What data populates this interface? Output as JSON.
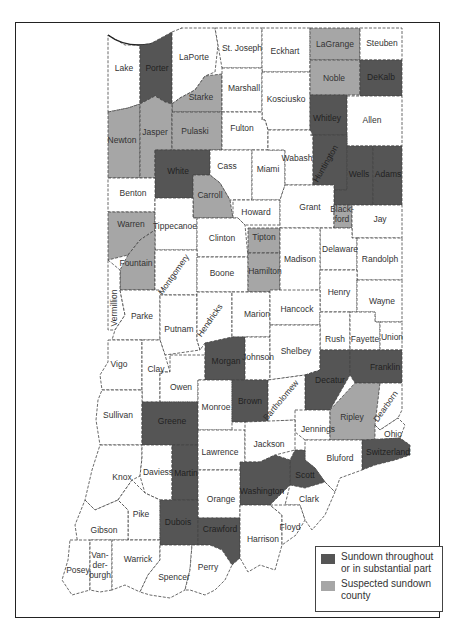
{
  "map": {
    "title": "Indiana sundown counties",
    "colors": {
      "sundown": "#555555",
      "suspected": "#a6a6a6",
      "none": "#ffffff"
    },
    "counties": [
      {
        "name": "Lake",
        "status": "none"
      },
      {
        "name": "Porter",
        "status": "sundown"
      },
      {
        "name": "LaPorte",
        "status": "none"
      },
      {
        "name": "St. Joseph",
        "status": "none"
      },
      {
        "name": "Eckhart",
        "status": "none"
      },
      {
        "name": "LaGrange",
        "status": "suspected"
      },
      {
        "name": "Steuben",
        "status": "none"
      },
      {
        "name": "Noble",
        "status": "suspected"
      },
      {
        "name": "DeKalb",
        "status": "sundown"
      },
      {
        "name": "Starke",
        "status": "suspected"
      },
      {
        "name": "Marshall",
        "status": "none"
      },
      {
        "name": "Kosciusko",
        "status": "none"
      },
      {
        "name": "Whitley",
        "status": "sundown"
      },
      {
        "name": "Allen",
        "status": "none"
      },
      {
        "name": "Newton",
        "status": "suspected"
      },
      {
        "name": "Jasper",
        "status": "suspected"
      },
      {
        "name": "Pulaski",
        "status": "suspected"
      },
      {
        "name": "Fulton",
        "status": "none"
      },
      {
        "name": "White",
        "status": "sundown"
      },
      {
        "name": "Cass",
        "status": "none"
      },
      {
        "name": "Miami",
        "status": "none"
      },
      {
        "name": "Wabash",
        "status": "none"
      },
      {
        "name": "Huntington",
        "status": "sundown"
      },
      {
        "name": "Wells",
        "status": "sundown"
      },
      {
        "name": "Adams",
        "status": "sundown"
      },
      {
        "name": "Benton",
        "status": "none"
      },
      {
        "name": "Carroll",
        "status": "suspected"
      },
      {
        "name": "Howard",
        "status": "none"
      },
      {
        "name": "Grant",
        "status": "none"
      },
      {
        "name": "Blackford",
        "status": "suspected"
      },
      {
        "name": "Jay",
        "status": "none"
      },
      {
        "name": "Warren",
        "status": "suspected"
      },
      {
        "name": "Tippecanoe",
        "status": "none"
      },
      {
        "name": "Clinton",
        "status": "none"
      },
      {
        "name": "Tipton",
        "status": "suspected"
      },
      {
        "name": "Delaware",
        "status": "none"
      },
      {
        "name": "Randolph",
        "status": "none"
      },
      {
        "name": "Fountain",
        "status": "suspected"
      },
      {
        "name": "Montgomery",
        "status": "none"
      },
      {
        "name": "Boone",
        "status": "none"
      },
      {
        "name": "Hamilton",
        "status": "suspected"
      },
      {
        "name": "Madison",
        "status": "none"
      },
      {
        "name": "Henry",
        "status": "none"
      },
      {
        "name": "Wayne",
        "status": "none"
      },
      {
        "name": "Vermillion",
        "status": "none"
      },
      {
        "name": "Parke",
        "status": "none"
      },
      {
        "name": "Putnam",
        "status": "none"
      },
      {
        "name": "Hendricks",
        "status": "none"
      },
      {
        "name": "Marion",
        "status": "none"
      },
      {
        "name": "Hancock",
        "status": "none"
      },
      {
        "name": "Rush",
        "status": "none"
      },
      {
        "name": "Fayette",
        "status": "none"
      },
      {
        "name": "Union",
        "status": "none"
      },
      {
        "name": "Vigo",
        "status": "none"
      },
      {
        "name": "Clay",
        "status": "none"
      },
      {
        "name": "Owen",
        "status": "none"
      },
      {
        "name": "Morgan",
        "status": "sundown"
      },
      {
        "name": "Johnson",
        "status": "none"
      },
      {
        "name": "Shelbey",
        "status": "none"
      },
      {
        "name": "Decatur",
        "status": "sundown"
      },
      {
        "name": "Franklin",
        "status": "sundown"
      },
      {
        "name": "Sullivan",
        "status": "none"
      },
      {
        "name": "Greene",
        "status": "sundown"
      },
      {
        "name": "Monroe",
        "status": "none"
      },
      {
        "name": "Brown",
        "status": "sundown"
      },
      {
        "name": "Bartholomew",
        "status": "none"
      },
      {
        "name": "Jennings",
        "status": "none"
      },
      {
        "name": "Ripley",
        "status": "suspected"
      },
      {
        "name": "Dearborn",
        "status": "none"
      },
      {
        "name": "Ohio",
        "status": "none"
      },
      {
        "name": "Switzerland",
        "status": "sundown"
      },
      {
        "name": "Knox",
        "status": "none"
      },
      {
        "name": "Daviess",
        "status": "none"
      },
      {
        "name": "Martin",
        "status": "sundown"
      },
      {
        "name": "Lawrence",
        "status": "none"
      },
      {
        "name": "Jackson",
        "status": "none"
      },
      {
        "name": "Bluford",
        "status": "none"
      },
      {
        "name": "Scott",
        "status": "sundown"
      },
      {
        "name": "Washington",
        "status": "sundown"
      },
      {
        "name": "Orange",
        "status": "none"
      },
      {
        "name": "Clark",
        "status": "none"
      },
      {
        "name": "Pike",
        "status": "none"
      },
      {
        "name": "Dubois",
        "status": "sundown"
      },
      {
        "name": "Crawford",
        "status": "sundown"
      },
      {
        "name": "Floyd",
        "status": "none"
      },
      {
        "name": "Harrison",
        "status": "none"
      },
      {
        "name": "Gibson",
        "status": "none"
      },
      {
        "name": "Posey",
        "status": "none"
      },
      {
        "name": "Vanderburgh",
        "status": "none",
        "label_lines": [
          "Van-",
          "der-",
          "burgh"
        ]
      },
      {
        "name": "Warrick",
        "status": "none"
      },
      {
        "name": "Spencer",
        "status": "none"
      },
      {
        "name": "Perry",
        "status": "none"
      }
    ]
  },
  "legend": {
    "items": [
      {
        "label": "Sundown throughout or in substantial part",
        "color": "#555555"
      },
      {
        "label": "Suspected sundown county",
        "color": "#a6a6a6"
      }
    ],
    "line1a": "Sundown throughout",
    "line1b": "or in substantial part",
    "line2a": "Suspected sundown",
    "line2b": "county"
  }
}
